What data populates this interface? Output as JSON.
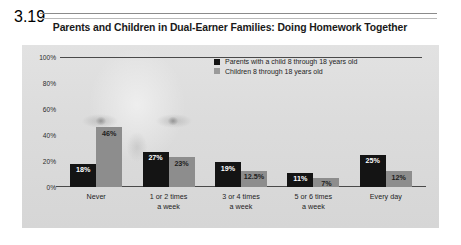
{
  "figure": {
    "number": "3.19",
    "title": "Parents and Children in Dual-Earner Families: Doing Homework Together",
    "footnote": "Significance: ***=p<.0001."
  },
  "legend": {
    "entries": [
      {
        "label": "Parents with a child 8 through 18 years old",
        "color": "#141414"
      },
      {
        "label": "Children 8 through 18 years old",
        "color": "#9a9a9a"
      }
    ]
  },
  "axis": {
    "yticks": [
      "100%",
      "80%",
      "60%",
      "40%",
      "20%",
      "0%"
    ]
  },
  "chart_data": {
    "type": "bar",
    "title": "Parents and Children in Dual-Earner Families: Doing Homework Together",
    "xlabel": "",
    "ylabel": "",
    "ylim": [
      0,
      100
    ],
    "grid": false,
    "legend_position": "top-right",
    "categories": [
      "Never",
      "1 or 2 times a week",
      "3 or 4 times a week",
      "5 or 6 times a week",
      "Every day"
    ],
    "category_lines": [
      [
        "Never",
        ""
      ],
      [
        "1 or 2 times",
        "a week"
      ],
      [
        "3 or 4 times",
        "a week"
      ],
      [
        "5 or 6 times",
        "a week"
      ],
      [
        "Every day",
        ""
      ]
    ],
    "series": [
      {
        "name": "Parents with a child 8 through 18 years old",
        "color": "#141414",
        "values": [
          18,
          27,
          19,
          11,
          25
        ],
        "labels": [
          "18%",
          "27%",
          "19%",
          "11%",
          "25%"
        ]
      },
      {
        "name": "Children 8 through 18 years old",
        "color": "#8d8d8d",
        "values": [
          46,
          23,
          12.5,
          7,
          12
        ],
        "labels": [
          "46%",
          "23%",
          "12.5%",
          "7%",
          "12%"
        ]
      }
    ]
  }
}
